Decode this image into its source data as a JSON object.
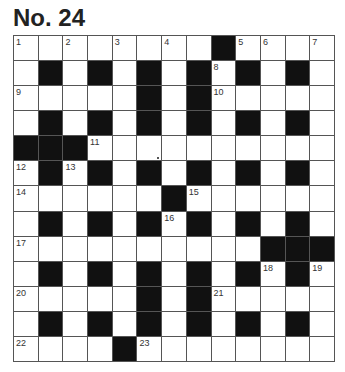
{
  "puzzle": {
    "title": "No. 24",
    "rows": 13,
    "cols": 13,
    "colors": {
      "black_cell": "#111111",
      "white_cell": "#ffffff",
      "grid_line": "#555555",
      "title": "#222222"
    },
    "layout": [
      "........#....",
      ".#.#.#.#.#.#.",
      ".....#.#.....",
      ".#.#.#.#.#.#.",
      "###..........",
      ".#.#.#.#.#.#.",
      "......#......",
      ".#.#.#.#.#.#.",
      "..........###",
      ".#.#.#.#.#.#.",
      ".....#.#.....",
      ".#.#.#.#.#.#.",
      "....#........"
    ],
    "numbers": [
      {
        "n": "1",
        "r": 0,
        "c": 0
      },
      {
        "n": "2",
        "r": 0,
        "c": 2
      },
      {
        "n": "3",
        "r": 0,
        "c": 4
      },
      {
        "n": "4",
        "r": 0,
        "c": 6
      },
      {
        "n": "5",
        "r": 0,
        "c": 9
      },
      {
        "n": "6",
        "r": 0,
        "c": 10
      },
      {
        "n": "7",
        "r": 0,
        "c": 12
      },
      {
        "n": "8",
        "r": 1,
        "c": 8
      },
      {
        "n": "9",
        "r": 2,
        "c": 0
      },
      {
        "n": "10",
        "r": 2,
        "c": 8
      },
      {
        "n": "11",
        "r": 4,
        "c": 3
      },
      {
        "n": "12",
        "r": 5,
        "c": 0
      },
      {
        "n": "13",
        "r": 5,
        "c": 2
      },
      {
        "n": "14",
        "r": 6,
        "c": 0
      },
      {
        "n": "15",
        "r": 6,
        "c": 7
      },
      {
        "n": "16",
        "r": 7,
        "c": 6
      },
      {
        "n": "17",
        "r": 8,
        "c": 0
      },
      {
        "n": "18",
        "r": 9,
        "c": 10
      },
      {
        "n": "19",
        "r": 9,
        "c": 12
      },
      {
        "n": "20",
        "r": 10,
        "c": 0
      },
      {
        "n": "21",
        "r": 10,
        "c": 8
      },
      {
        "n": "22",
        "r": 12,
        "c": 0
      },
      {
        "n": "23",
        "r": 12,
        "c": 5
      }
    ]
  }
}
